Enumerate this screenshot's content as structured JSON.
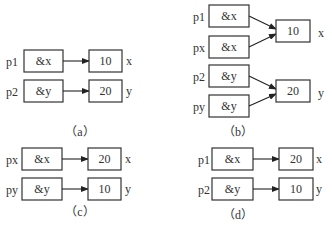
{
  "panels": {
    "a": {
      "caption": "（a）",
      "pointers": [
        {
          "name": "p1",
          "value": "&x"
        },
        {
          "name": "p2",
          "value": "&y"
        }
      ],
      "targets": [
        {
          "name": "x",
          "value": "10"
        },
        {
          "name": "y",
          "value": "20"
        }
      ]
    },
    "b": {
      "caption": "（b）",
      "pointers": [
        {
          "name": "p1",
          "value": "&x"
        },
        {
          "name": "px",
          "value": "&x"
        },
        {
          "name": "p2",
          "value": "&y"
        },
        {
          "name": "py",
          "value": "&y"
        }
      ],
      "targets": [
        {
          "name": "x",
          "value": "10"
        },
        {
          "name": "y",
          "value": "20"
        }
      ]
    },
    "c": {
      "caption": "（c）",
      "pointers": [
        {
          "name": "px",
          "value": "&x"
        },
        {
          "name": "py",
          "value": "&y"
        }
      ],
      "targets": [
        {
          "name": "x",
          "value": "20"
        },
        {
          "name": "y",
          "value": "10"
        }
      ]
    },
    "d": {
      "caption": "（d）",
      "pointers": [
        {
          "name": "p1",
          "value": "&x"
        },
        {
          "name": "p2",
          "value": "&y"
        }
      ],
      "targets": [
        {
          "name": "x",
          "value": "20"
        },
        {
          "name": "y",
          "value": "10"
        }
      ]
    }
  },
  "colors": {
    "stroke": "#333333",
    "background": "#ffffff"
  }
}
